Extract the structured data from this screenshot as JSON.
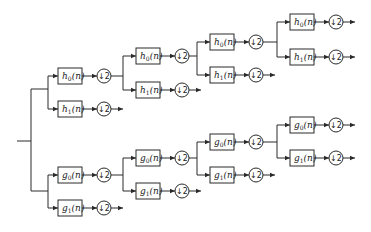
{
  "diagram": {
    "title": "",
    "type": "wavelet packet decomposition filter bank tree",
    "colors": {
      "line": "#2a2a2a",
      "text": "#1a1a1a",
      "background": "#ffffff"
    },
    "downsample_label": "↓2",
    "branches": {
      "upper": {
        "level1": {
          "top": "h0(n)",
          "bottom": "h1(n)"
        },
        "level2": {
          "top": "h0(n)",
          "bottom": "h1(n)"
        },
        "level3": {
          "top": "h0(n)",
          "bottom": "h1(n)"
        },
        "level4": {
          "top": "h0(n)",
          "bottom": "h1(n)"
        }
      },
      "lower": {
        "level1": {
          "top": "g0(n)",
          "bottom": "g1(n)"
        },
        "level2": {
          "top": "g0(n)",
          "bottom": "g1(n)"
        },
        "level3": {
          "top": "g0(n)",
          "bottom": "g1(n)"
        },
        "level4": {
          "top": "g0(n)",
          "bottom": "g1(n)"
        }
      }
    },
    "filters": [
      {
        "id": "u1a",
        "base": "h",
        "sub": "0",
        "x": 58,
        "y": 76
      },
      {
        "id": "u1b",
        "base": "h",
        "sub": "1",
        "x": 58,
        "y": 109
      },
      {
        "id": "u2a",
        "base": "h",
        "sub": "0",
        "x": 136,
        "y": 56
      },
      {
        "id": "u2b",
        "base": "h",
        "sub": "1",
        "x": 136,
        "y": 90
      },
      {
        "id": "u3a",
        "base": "h",
        "sub": "0",
        "x": 210,
        "y": 42
      },
      {
        "id": "u3b",
        "base": "h",
        "sub": "1",
        "x": 210,
        "y": 75
      },
      {
        "id": "u4a",
        "base": "h",
        "sub": "0",
        "x": 290,
        "y": 22
      },
      {
        "id": "u4b",
        "base": "h",
        "sub": "1",
        "x": 290,
        "y": 57
      },
      {
        "id": "l1a",
        "base": "g",
        "sub": "0",
        "x": 58,
        "y": 175
      },
      {
        "id": "l1b",
        "base": "g",
        "sub": "1",
        "x": 58,
        "y": 208
      },
      {
        "id": "l2a",
        "base": "g",
        "sub": "0",
        "x": 136,
        "y": 158
      },
      {
        "id": "l2b",
        "base": "g",
        "sub": "1",
        "x": 136,
        "y": 191
      },
      {
        "id": "l3a",
        "base": "g",
        "sub": "0",
        "x": 210,
        "y": 142
      },
      {
        "id": "l3b",
        "base": "g",
        "sub": "1",
        "x": 210,
        "y": 175
      },
      {
        "id": "l4a",
        "base": "g",
        "sub": "0",
        "x": 290,
        "y": 125
      },
      {
        "id": "l4b",
        "base": "g",
        "sub": "1",
        "x": 290,
        "y": 158
      }
    ],
    "filter_suffix": "(n)"
  }
}
